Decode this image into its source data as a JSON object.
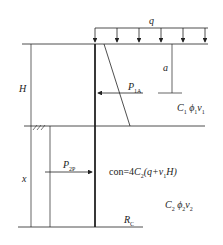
{
  "diagram": {
    "type": "retaining-wall-earth-pressure",
    "labels": {
      "q": "q",
      "a": "a",
      "H": "H",
      "x": "x",
      "P1A_main": "P",
      "P1A_sub": "1A",
      "P2P_main": "P",
      "P2P_sub": "2P",
      "layer1_C": "C",
      "layer1_C_sub": "1",
      "layer1_phi": "ϕ",
      "layer1_phi_sub": "1",
      "layer1_v": "v",
      "layer1_v_sub": "1",
      "layer2_C": "C",
      "layer2_C_sub": "2",
      "layer2_phi": "ϕ",
      "layer2_phi_sub": "2",
      "layer2_v": "v",
      "layer2_v_sub": "2",
      "con_prefix": "con=4",
      "con_C": "C",
      "con_C_sub": "2",
      "con_rest1": "(q+v",
      "con_v_sub": "1",
      "con_rest2": "H)",
      "Rc_main": "R",
      "Rc_sub": "C"
    },
    "caption": ""
  }
}
